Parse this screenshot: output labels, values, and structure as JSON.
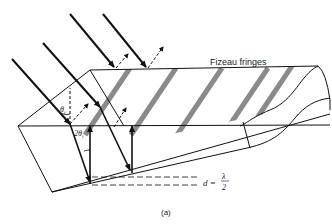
{
  "figure": {
    "label": "(a)",
    "title_label": "Fizeau fringes",
    "angle_incident": "θ",
    "angle_incident_sub": "i",
    "angle_double": "2θ",
    "angle_double_sub": "i",
    "spacing_lhs": "d =",
    "spacing_num": "λ",
    "spacing_den": "2"
  },
  "colors": {
    "line": "#111111",
    "fringe": "#8a8a8a",
    "background": "#ffffff"
  }
}
